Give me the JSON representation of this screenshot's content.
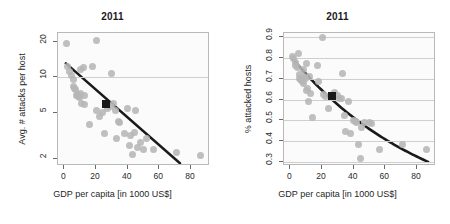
{
  "figure": {
    "panel_count": 2,
    "background_color": "#ffffff",
    "point_color": "#b6b6b6",
    "fit_line_color": "#1a1a1a",
    "marker_color": "#1a1a1a",
    "grid_color": "#cfcfcf",
    "frame_color": "#b9b9b9"
  },
  "chart_data": [
    {
      "id": "left-panel",
      "type": "scatter",
      "title": "2011",
      "xlabel": "GDP per capita [in 1000 US$]",
      "ylabel": "Avg. # attacks per host",
      "yscale": "log",
      "xscale": "linear",
      "xlim": [
        -4,
        92
      ],
      "ylim": [
        1.75,
        24
      ],
      "xticks": [
        0,
        20,
        40,
        60,
        80
      ],
      "xticklabels": [
        "0",
        "20",
        "40",
        "60",
        "80"
      ],
      "yticks": [
        2,
        5,
        10,
        20
      ],
      "yticklabels": [
        "2",
        "5",
        "10",
        "20"
      ],
      "gridlines_y": [
        10
      ],
      "grid": true,
      "legend": "none",
      "points": [
        [
          1.5,
          19.5
        ],
        [
          2.0,
          12.5
        ],
        [
          3.5,
          11.2
        ],
        [
          4.5,
          10.4
        ],
        [
          5.5,
          9.6
        ],
        [
          6.0,
          8.3
        ],
        [
          6.5,
          8.0
        ],
        [
          7.0,
          7.9
        ],
        [
          7.5,
          7.0
        ],
        [
          8.0,
          7.2
        ],
        [
          8.5,
          7.0
        ],
        [
          9.0,
          6.9
        ],
        [
          9.5,
          6.8
        ],
        [
          10.0,
          11.6
        ],
        [
          10.5,
          7.3
        ],
        [
          11.0,
          6.0
        ],
        [
          12.0,
          12.2
        ],
        [
          12.5,
          5.9
        ],
        [
          13.0,
          7.0
        ],
        [
          16.0,
          4.0
        ],
        [
          18.0,
          12.5
        ],
        [
          20.0,
          20.8
        ],
        [
          20.5,
          5.2
        ],
        [
          22.0,
          4.6
        ],
        [
          24.0,
          5.0
        ],
        [
          25.5,
          3.3
        ],
        [
          27.0,
          5.4
        ],
        [
          29.0,
          5.6
        ],
        [
          30.0,
          10.8
        ],
        [
          31.0,
          6.0
        ],
        [
          32.0,
          5.2
        ],
        [
          33.0,
          3.0
        ],
        [
          34.0,
          4.2
        ],
        [
          35.0,
          4.1
        ],
        [
          38.0,
          3.3
        ],
        [
          40.0,
          5.4
        ],
        [
          41.0,
          2.6
        ],
        [
          42.0,
          3.2
        ],
        [
          43.0,
          2.2
        ],
        [
          44.0,
          3.4
        ],
        [
          45.0,
          5.2
        ],
        [
          46.0,
          2.5
        ],
        [
          48.0,
          2.8
        ],
        [
          50.0,
          2.4
        ],
        [
          52.0,
          3.0
        ],
        [
          56.0,
          2.4
        ],
        [
          71.0,
          2.3
        ],
        [
          86.0,
          2.15
        ]
      ],
      "highlight_point": [
        26,
        5.9
      ],
      "fit_line": {
        "description": "log-linear decreasing fit",
        "x_start": 1,
        "y_start": 13.2,
        "x_end": 73,
        "y_end": 1.85
      }
    },
    {
      "id": "right-panel",
      "type": "scatter",
      "title": "2011",
      "xlabel": "GDP per capita [in 1000 US$]",
      "ylabel": "% attacked hosts",
      "yscale": "linear",
      "xscale": "linear",
      "xlim": [
        -4,
        92
      ],
      "ylim": [
        0.28,
        0.92
      ],
      "xticks": [
        0,
        20,
        40,
        60,
        80
      ],
      "xticklabels": [
        "0",
        "20",
        "40",
        "60",
        "80"
      ],
      "yticks": [
        0.3,
        0.4,
        0.5,
        0.6,
        0.7,
        0.8,
        0.9
      ],
      "yticklabels": [
        "0.3",
        "0.4",
        "0.5",
        "0.6",
        "0.7",
        "0.8",
        "0.9"
      ],
      "gridlines_y": [
        0.3,
        0.4,
        0.5,
        0.6,
        0.7,
        0.8,
        0.9
      ],
      "grid": true,
      "legend": "none",
      "points": [
        [
          1.5,
          0.805
        ],
        [
          2.0,
          0.795
        ],
        [
          3.0,
          0.78
        ],
        [
          3.5,
          0.765
        ],
        [
          4.5,
          0.755
        ],
        [
          5.0,
          0.82
        ],
        [
          5.5,
          0.72
        ],
        [
          6.0,
          0.7
        ],
        [
          6.5,
          0.695
        ],
        [
          7.0,
          0.69
        ],
        [
          7.5,
          0.685
        ],
        [
          8.0,
          0.675
        ],
        [
          8.5,
          0.745
        ],
        [
          9.0,
          0.71
        ],
        [
          9.5,
          0.7
        ],
        [
          10.0,
          0.775
        ],
        [
          10.5,
          0.645
        ],
        [
          11.0,
          0.655
        ],
        [
          11.5,
          0.59
        ],
        [
          12.0,
          0.71
        ],
        [
          13.0,
          0.63
        ],
        [
          14.0,
          0.515
        ],
        [
          17.0,
          0.765
        ],
        [
          18.0,
          0.685
        ],
        [
          20.0,
          0.9
        ],
        [
          21.0,
          0.625
        ],
        [
          22.0,
          0.615
        ],
        [
          24.0,
          0.555
        ],
        [
          28.0,
          0.635
        ],
        [
          30.0,
          0.62
        ],
        [
          31.0,
          0.605
        ],
        [
          32.0,
          0.605
        ],
        [
          33.0,
          0.725
        ],
        [
          34.0,
          0.525
        ],
        [
          35.0,
          0.445
        ],
        [
          37.0,
          0.59
        ],
        [
          38.0,
          0.435
        ],
        [
          40.0,
          0.5
        ],
        [
          41.0,
          0.495
        ],
        [
          42.0,
          0.49
        ],
        [
          43.0,
          0.385
        ],
        [
          44.0,
          0.315
        ],
        [
          45.0,
          0.465
        ],
        [
          47.0,
          0.49
        ],
        [
          50.0,
          0.49
        ],
        [
          51.0,
          0.485
        ],
        [
          56.0,
          0.36
        ],
        [
          71.0,
          0.385
        ],
        [
          86.0,
          0.36
        ]
      ],
      "highlight_point": [
        26,
        0.615
      ],
      "fit_line": {
        "description": "exponential decay fit",
        "x_start": 1,
        "y_start": 0.8,
        "x_end": 87,
        "y_end": 0.3
      }
    }
  ]
}
